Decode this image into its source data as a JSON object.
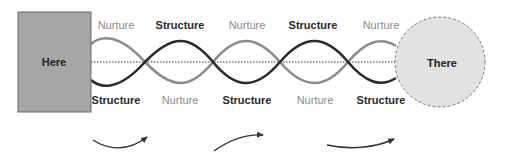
{
  "diagram": {
    "start_node": {
      "label": "Here",
      "shape": "rectangle",
      "fill": "#a6a6a6",
      "stroke": "#6a6a6a"
    },
    "end_node": {
      "label": "There",
      "shape": "circle",
      "fill": "#e2e2e2",
      "stroke": "#777777",
      "stroke_style": "dashed"
    },
    "midline": {
      "style": "dotted",
      "color": "#333333"
    },
    "strands": [
      {
        "name": "Nurture",
        "color": "#8c8c8c"
      },
      {
        "name": "Structure",
        "color": "#2b2b2b"
      }
    ],
    "top_labels": [
      {
        "text": "Nurture",
        "kind": "nurture"
      },
      {
        "text": "Structure",
        "kind": "structure"
      },
      {
        "text": "Nurture",
        "kind": "nurture"
      },
      {
        "text": "Structure",
        "kind": "structure"
      },
      {
        "text": "Nurture",
        "kind": "nurture"
      }
    ],
    "bottom_labels": [
      {
        "text": "Structure",
        "kind": "structure"
      },
      {
        "text": "Nurture",
        "kind": "nurture"
      },
      {
        "text": "Structure",
        "kind": "structure"
      },
      {
        "text": "Nurture",
        "kind": "nurture"
      },
      {
        "text": "Structure",
        "kind": "structure"
      }
    ],
    "arrows": [
      {
        "direction": "right",
        "shape": "curve-up"
      },
      {
        "direction": "right",
        "shape": "arc-up"
      },
      {
        "direction": "right",
        "shape": "curve-up"
      }
    ]
  }
}
